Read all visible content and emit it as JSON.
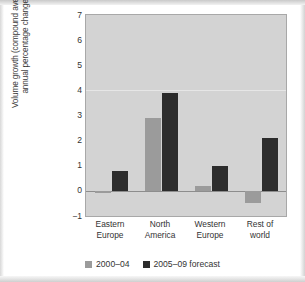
{
  "chart_data": {
    "type": "bar",
    "title": "",
    "subtitle": "",
    "xlabel": "",
    "ylabel": "Volume growth (compound average\nannual percentage change)",
    "categories": [
      "Eastern\nEurope",
      "North\nAmerica",
      "Western\nEurope",
      "Rest of\nworld"
    ],
    "series": [
      {
        "name": "2000–04",
        "color": "#9b9b9b",
        "values": [
          -0.1,
          2.9,
          0.2,
          -0.5
        ]
      },
      {
        "name": "2005–09 forecast",
        "color": "#2c2c2c",
        "values": [
          0.8,
          3.9,
          1.0,
          2.1
        ]
      }
    ],
    "ylim": [
      -1,
      7
    ],
    "yticks": [
      "7",
      "6",
      "5",
      "4",
      "3",
      "2",
      "1",
      "0",
      "-1"
    ],
    "ytick_values": [
      7,
      6,
      5,
      4,
      3,
      2,
      1,
      0,
      -1
    ],
    "gridlines_at": [
      4
    ],
    "grid": true,
    "legend_position": "bottom",
    "plot_background": "#d3d3d3"
  },
  "legend": {
    "items": [
      {
        "label": "2000–04",
        "swatch": "grey"
      },
      {
        "label": "2005–09 forecast",
        "swatch": "dark"
      }
    ]
  }
}
